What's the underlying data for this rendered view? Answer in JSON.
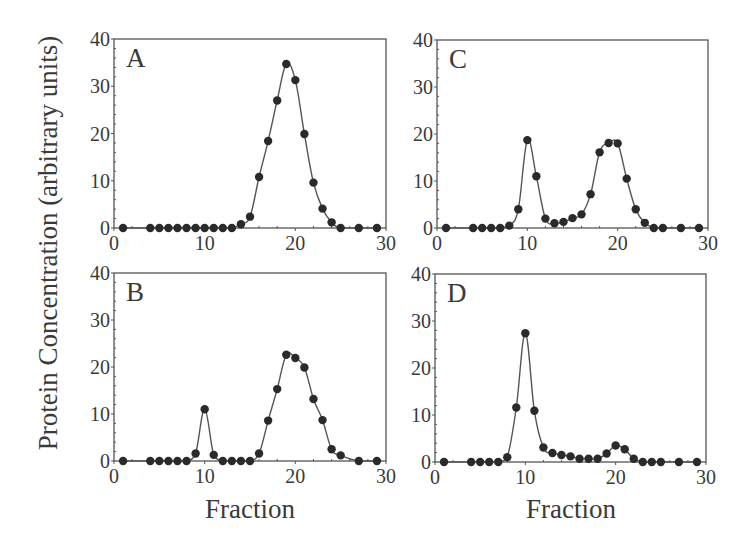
{
  "figure": {
    "y_axis_title": "Protein Concentration (arbitrary units)",
    "x_axis_titles": [
      "Fraction",
      "Fraction"
    ],
    "colors": {
      "axis": "#555555",
      "line": "#555555",
      "marker": "#2a2a2a",
      "text": "#3a3a3a"
    }
  },
  "chart_data": [
    {
      "type": "line",
      "panel": "A",
      "title": "A",
      "xlabel": "Fraction",
      "ylabel": "Protein Concentration (arbitrary units)",
      "xlim": [
        0,
        30
      ],
      "ylim": [
        0,
        40
      ],
      "xticks": [
        0,
        10,
        20,
        30
      ],
      "yticks": [
        0,
        10,
        20,
        30,
        40
      ],
      "grid": false,
      "x": [
        1,
        4,
        5,
        6,
        7,
        8,
        9,
        10,
        11,
        12,
        13,
        14,
        15,
        16,
        17,
        18,
        19,
        20,
        21,
        22,
        23,
        24,
        25,
        27,
        29
      ],
      "y": [
        0,
        0,
        0,
        0,
        0,
        0,
        0,
        0,
        0,
        0,
        0,
        0.8,
        2.4,
        10.8,
        18.4,
        27,
        34.7,
        31.3,
        19.9,
        9.6,
        4.1,
        1.2,
        0,
        0,
        0
      ]
    },
    {
      "type": "line",
      "panel": "B",
      "title": "B",
      "xlabel": "Fraction",
      "ylabel": "Protein Concentration (arbitrary units)",
      "xlim": [
        0,
        30
      ],
      "ylim": [
        0,
        40
      ],
      "xticks": [
        0,
        10,
        20,
        30
      ],
      "yticks": [
        0,
        10,
        20,
        30,
        40
      ],
      "grid": false,
      "x": [
        1,
        4,
        5,
        6,
        7,
        8,
        9,
        10,
        11,
        12,
        13,
        14,
        15,
        16,
        17,
        18,
        19,
        20,
        21,
        22,
        23,
        24,
        25,
        27,
        29
      ],
      "y": [
        0,
        0,
        0,
        0,
        0,
        0,
        1.6,
        11,
        1.3,
        0,
        0,
        0,
        0,
        1.6,
        8.6,
        15.3,
        22.6,
        21.9,
        19.9,
        13.2,
        8.7,
        2.5,
        1.2,
        0,
        0
      ]
    },
    {
      "type": "line",
      "panel": "C",
      "title": "C",
      "xlabel": "Fraction",
      "ylabel": "Protein Concentration (arbitrary units)",
      "xlim": [
        0,
        30
      ],
      "ylim": [
        0,
        40
      ],
      "xticks": [
        0,
        10,
        20,
        30
      ],
      "yticks": [
        0,
        10,
        20,
        30,
        40
      ],
      "grid": false,
      "x": [
        1,
        4,
        5,
        6,
        7,
        8,
        9,
        10,
        11,
        12,
        13,
        14,
        15,
        16,
        17,
        18,
        19,
        20,
        21,
        22,
        23,
        24,
        25,
        27,
        29
      ],
      "y": [
        0,
        0,
        0,
        0,
        0,
        0.5,
        4,
        18.7,
        11,
        2,
        1,
        1.3,
        2.1,
        2.9,
        7.2,
        16.1,
        18.1,
        18,
        10.5,
        4,
        1.1,
        0,
        0,
        0,
        0
      ]
    },
    {
      "type": "line",
      "panel": "D",
      "title": "D",
      "xlabel": "Fraction",
      "ylabel": "Protein Concentration (arbitrary units)",
      "xlim": [
        0,
        30
      ],
      "ylim": [
        0,
        40
      ],
      "xticks": [
        0,
        10,
        20,
        30
      ],
      "yticks": [
        0,
        10,
        20,
        30,
        40
      ],
      "grid": false,
      "x": [
        1,
        4,
        5,
        6,
        7,
        8,
        9,
        10,
        11,
        12,
        13,
        14,
        15,
        16,
        17,
        18,
        19,
        20,
        21,
        22,
        23,
        24,
        25,
        27,
        29
      ],
      "y": [
        0,
        0,
        0,
        0,
        0,
        1,
        11.6,
        27.4,
        10.9,
        3.1,
        1.9,
        1.5,
        1.2,
        0.7,
        0.7,
        0.7,
        1.8,
        3.5,
        2.7,
        0.7,
        0,
        0,
        0,
        0,
        0
      ]
    }
  ]
}
